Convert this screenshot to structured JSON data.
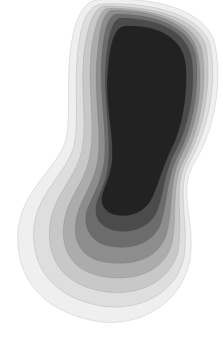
{
  "image": {
    "description": "Abstract grayscale artwork of nested, peanut-shaped contour layers darkening toward the center",
    "background": "#ffffff",
    "layers": [
      {
        "name": "layer-1",
        "fill": "#ececec",
        "opacity": 0.85
      },
      {
        "name": "layer-2",
        "fill": "#dadada",
        "opacity": 0.85
      },
      {
        "name": "layer-3",
        "fill": "#c4c4c4",
        "opacity": 0.85
      },
      {
        "name": "layer-4",
        "fill": "#a8a8a8",
        "opacity": 0.9
      },
      {
        "name": "layer-5",
        "fill": "#8a8a8a",
        "opacity": 0.9
      },
      {
        "name": "layer-6",
        "fill": "#6a6a6a",
        "opacity": 0.95
      },
      {
        "name": "layer-7",
        "fill": "#4a4a4a",
        "opacity": 0.95
      },
      {
        "name": "core",
        "fill": "#222222",
        "opacity": 1
      }
    ]
  }
}
